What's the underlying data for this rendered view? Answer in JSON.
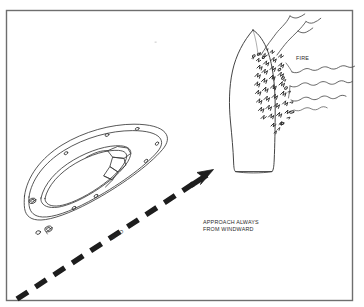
{
  "figure": {
    "kind": "line-drawing-diagram",
    "border_color": "#6e6e6e",
    "ink_color": "#2f2f2f",
    "background_color": "#ffffff",
    "labels": {
      "fire": "FIRE",
      "wind": "WIND",
      "approach_line1": "APPROACH ALWAYS",
      "approach_line2": "FROM WINDWARD"
    },
    "elements": {
      "rescue_boat": "rescue-boat-top-view",
      "burning_vessel": "burning-vessel-top-view",
      "flames": "flames",
      "smoke": "smoke-plume",
      "wind_arrow": "dashed-wind-direction-arrow"
    }
  }
}
